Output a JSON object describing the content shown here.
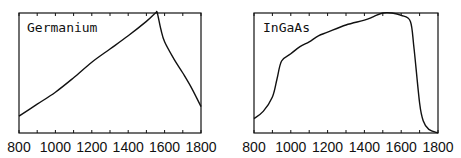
{
  "chart_data": [
    {
      "type": "line",
      "title": "Germanium",
      "xlabel": "",
      "ylabel": "",
      "xlim": [
        800,
        1800
      ],
      "ylim": [
        0,
        1
      ],
      "grid": false,
      "x_ticks": [
        "800",
        "1000",
        "1200",
        "1400",
        "1600",
        "1800"
      ],
      "x": [
        800,
        900,
        1000,
        1100,
        1200,
        1300,
        1400,
        1500,
        1550,
        1560,
        1580,
        1600,
        1650,
        1700,
        1750,
        1800
      ],
      "values": [
        0.14,
        0.24,
        0.34,
        0.46,
        0.59,
        0.7,
        0.81,
        0.93,
        1.0,
        1.0,
        0.86,
        0.76,
        0.62,
        0.5,
        0.37,
        0.22
      ]
    },
    {
      "type": "line",
      "title": "InGaAs",
      "xlabel": "",
      "ylabel": "",
      "xlim": [
        800,
        1800
      ],
      "ylim": [
        0,
        1
      ],
      "grid": false,
      "x_ticks": [
        "800",
        "1000",
        "1200",
        "1400",
        "1600",
        "1800"
      ],
      "x": [
        800,
        850,
        900,
        925,
        950,
        1000,
        1050,
        1100,
        1150,
        1200,
        1300,
        1400,
        1450,
        1500,
        1550,
        1600,
        1650,
        1670,
        1700,
        1720,
        1750,
        1800
      ],
      "values": [
        0.12,
        0.18,
        0.3,
        0.45,
        0.6,
        0.66,
        0.72,
        0.76,
        0.81,
        0.84,
        0.9,
        0.94,
        0.97,
        1.0,
        1.0,
        0.98,
        0.93,
        0.7,
        0.25,
        0.1,
        0.03,
        0.0
      ]
    }
  ],
  "panels": {
    "left_label": "Germanium",
    "right_label": "InGaAs",
    "tick_labels": [
      "800",
      "1000",
      "1200",
      "1400",
      "1600",
      "1800"
    ]
  },
  "colors": {
    "line": "#111111",
    "axis": "#111111",
    "background": "#ffffff"
  }
}
